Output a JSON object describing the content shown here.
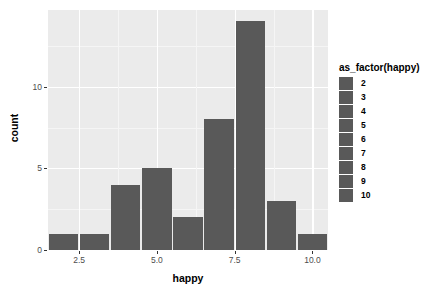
{
  "chart_data": {
    "type": "bar",
    "title": "",
    "xlabel": "happy",
    "ylabel": "count",
    "categories": [
      "2",
      "3",
      "4",
      "5",
      "6",
      "7",
      "8",
      "9",
      "10"
    ],
    "x": [
      2,
      3,
      4,
      5,
      6,
      7,
      8,
      9,
      10
    ],
    "values": [
      1,
      1,
      4,
      5,
      2,
      8,
      14,
      3,
      1
    ],
    "xlim": [
      1.5,
      10.5
    ],
    "ylim": [
      0,
      14.7
    ],
    "x_ticks": [
      2.5,
      5.0,
      7.5,
      10.0
    ],
    "x_tick_labels": [
      "2.5",
      "5.0",
      "7.5",
      "10.0"
    ],
    "x_minor_ticks": [
      3.75,
      6.25,
      8.75
    ],
    "y_ticks": [
      0,
      5,
      10
    ],
    "y_tick_labels": [
      "0",
      "5",
      "10"
    ],
    "y_minor_ticks": [
      2.5,
      7.5,
      12.5
    ],
    "grid": true,
    "legend_position": "right",
    "bar_fill": "#595959",
    "panel_background": "#ebebeb",
    "grid_color": "#ffffff",
    "legend": {
      "title": "as_factor(happy)",
      "entries": [
        {
          "label": "2",
          "color": "#595959"
        },
        {
          "label": "3",
          "color": "#595959"
        },
        {
          "label": "4",
          "color": "#595959"
        },
        {
          "label": "5",
          "color": "#595959"
        },
        {
          "label": "6",
          "color": "#595959"
        },
        {
          "label": "7",
          "color": "#595959"
        },
        {
          "label": "8",
          "color": "#595959"
        },
        {
          "label": "9",
          "color": "#595959"
        },
        {
          "label": "10",
          "color": "#595959"
        }
      ]
    }
  }
}
